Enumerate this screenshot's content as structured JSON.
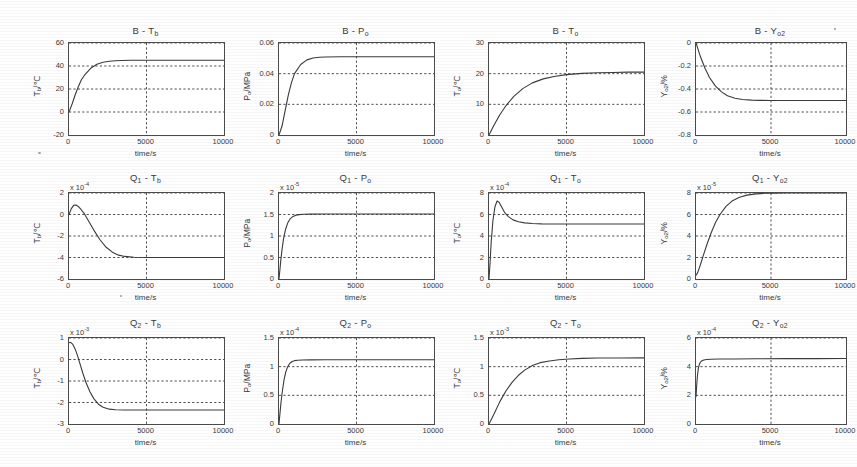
{
  "figure": {
    "xlabel": "time/s",
    "xticks": [
      "0",
      "5000",
      "10000"
    ],
    "background": "#ffffff",
    "line_color": "#3a3a3a",
    "grid_color": "#3a3a3a",
    "axis_color": "#4a4a4a"
  },
  "chart_data": [
    {
      "id": "b-tb",
      "type": "line",
      "title": "B - Tb",
      "title_main": "B - T",
      "title_sub": "b",
      "xlabel": "time/s",
      "ylabel_main": "T",
      "ylabel_sub": "b",
      "ylabel_unit": "/℃",
      "ylabel": "Tb/℃",
      "exponent": "",
      "xlim": [
        0,
        10000
      ],
      "ylim": [
        -20,
        60
      ],
      "xticks": [
        0,
        5000,
        10000
      ],
      "xticklabels": [
        "0",
        "5000",
        "10000"
      ],
      "yticks": [
        -20,
        0,
        20,
        40,
        60
      ],
      "yticklabels": [
        "-20",
        "0",
        "20",
        "40",
        "60"
      ],
      "grid": true,
      "x": [
        0,
        200,
        400,
        600,
        800,
        1000,
        1400,
        1800,
        2200,
        2600,
        3000,
        3400,
        4000,
        5000,
        6000,
        8000,
        10000
      ],
      "y": [
        0,
        7,
        15,
        22,
        28,
        32,
        38,
        41.5,
        43.3,
        44.1,
        44.6,
        44.8,
        45,
        45,
        45,
        45,
        45
      ]
    },
    {
      "id": "b-po",
      "type": "line",
      "title_main": "B - P",
      "title_sub": "o",
      "xlabel": "time/s",
      "ylabel_main": "P",
      "ylabel_sub": "o",
      "ylabel_unit": "/MPa",
      "ylabel": "Po/MPa",
      "exponent": "",
      "xlim": [
        0,
        10000
      ],
      "ylim": [
        0,
        0.06
      ],
      "xticks": [
        0,
        5000,
        10000
      ],
      "xticklabels": [
        "0",
        "5000",
        "10000"
      ],
      "yticks": [
        0,
        0.02,
        0.04,
        0.06
      ],
      "yticklabels": [
        "0",
        "0.02",
        "0.04",
        "0.06"
      ],
      "grid": true,
      "x": [
        0,
        200,
        400,
        600,
        800,
        1000,
        1400,
        1800,
        2200,
        2600,
        3000,
        4000,
        5000,
        7000,
        10000
      ],
      "y": [
        0,
        0.006,
        0.016,
        0.026,
        0.034,
        0.04,
        0.046,
        0.049,
        0.0502,
        0.0507,
        0.0509,
        0.051,
        0.051,
        0.051,
        0.051
      ]
    },
    {
      "id": "b-to",
      "type": "line",
      "title_main": "B - T",
      "title_sub": "o",
      "xlabel": "time/s",
      "ylabel_main": "T",
      "ylabel_sub": "o",
      "ylabel_unit": "/℃",
      "ylabel": "To/℃",
      "exponent": "",
      "xlim": [
        0,
        10000
      ],
      "ylim": [
        0,
        30
      ],
      "xticks": [
        0,
        5000,
        10000
      ],
      "xticklabels": [
        "0",
        "5000",
        "10000"
      ],
      "yticks": [
        0,
        10,
        20,
        30
      ],
      "yticklabels": [
        "0",
        "10",
        "20",
        "30"
      ],
      "grid": true,
      "x": [
        0,
        300,
        700,
        1100,
        1600,
        2200,
        2800,
        3500,
        4200,
        5000,
        6000,
        7000,
        8000,
        9000,
        10000
      ],
      "y": [
        0,
        3.0,
        6.6,
        9.6,
        12.6,
        15.2,
        17.0,
        18.3,
        19.1,
        19.7,
        20.1,
        20.3,
        20.4,
        20.5,
        20.5
      ]
    },
    {
      "id": "b-yo2",
      "type": "line",
      "title_main": "B - Y",
      "title_sub": "o2",
      "xlabel": "time/s",
      "ylabel_main": "Y",
      "ylabel_sub": "o2",
      "ylabel_unit": "/%",
      "ylabel": "Yo2/%",
      "exponent": "",
      "xlim": [
        0,
        10000
      ],
      "ylim": [
        -0.8,
        0
      ],
      "xticks": [
        0,
        5000,
        10000
      ],
      "xticklabels": [
        "0",
        "5000",
        "10000"
      ],
      "yticks": [
        -0.8,
        -0.6,
        -0.4,
        -0.2,
        0
      ],
      "yticklabels": [
        "-0.8",
        "-0.6",
        "-0.4",
        "-0.2",
        "0"
      ],
      "grid": true,
      "x": [
        0,
        300,
        600,
        900,
        1300,
        1700,
        2100,
        2600,
        3100,
        3700,
        4300,
        5000,
        7000,
        10000
      ],
      "y": [
        0,
        -0.12,
        -0.22,
        -0.3,
        -0.375,
        -0.425,
        -0.458,
        -0.48,
        -0.491,
        -0.497,
        -0.499,
        -0.5,
        -0.5,
        -0.5
      ]
    },
    {
      "id": "q1-tb",
      "type": "line",
      "title_main": "Q",
      "title_sub": "1",
      "title_tail": " - T",
      "title_tail_sub": "b",
      "xlabel": "time/s",
      "ylabel_main": "T",
      "ylabel_sub": "b",
      "ylabel_unit": "/℃",
      "ylabel": "Tb/℃",
      "exponent": "x 10",
      "exponent_sup": "-4",
      "xlim": [
        0,
        10000
      ],
      "ylim": [
        -6,
        2
      ],
      "xticks": [
        0,
        5000,
        10000
      ],
      "xticklabels": [
        "0",
        "5000",
        "10000"
      ],
      "yticks": [
        -6,
        -4,
        -2,
        0,
        2
      ],
      "yticklabels": [
        "-6",
        "-4",
        "-2",
        "0",
        "2"
      ],
      "grid": true,
      "x": [
        0,
        150,
        300,
        450,
        600,
        800,
        1000,
        1300,
        1600,
        2000,
        2400,
        2800,
        3200,
        3600,
        4200,
        5000,
        7000,
        10000
      ],
      "y": [
        0,
        0.55,
        0.85,
        0.88,
        0.75,
        0.42,
        0.05,
        -0.7,
        -1.45,
        -2.35,
        -3.05,
        -3.5,
        -3.78,
        -3.9,
        -3.97,
        -4.0,
        -4.0,
        -4.0
      ]
    },
    {
      "id": "q1-po",
      "type": "line",
      "title_main": "Q",
      "title_sub": "1",
      "title_tail": " - P",
      "title_tail_sub": "o",
      "xlabel": "time/s",
      "ylabel_main": "P",
      "ylabel_sub": "o",
      "ylabel_unit": "/MPa",
      "ylabel": "Po/MPa",
      "exponent": "x 10",
      "exponent_sup": "-5",
      "xlim": [
        0,
        10000
      ],
      "ylim": [
        0,
        2
      ],
      "xticks": [
        0,
        5000,
        10000
      ],
      "xticklabels": [
        "0",
        "5000",
        "10000"
      ],
      "yticks": [
        0,
        0.5,
        1,
        1.5,
        2
      ],
      "yticklabels": [
        "0",
        "0.5",
        "1",
        "1.5",
        "2"
      ],
      "grid": true,
      "x": [
        0,
        60,
        120,
        200,
        300,
        420,
        560,
        720,
        900,
        1100,
        1300,
        1600,
        2000,
        3000,
        5000,
        10000
      ],
      "y": [
        0,
        0.22,
        0.45,
        0.7,
        0.95,
        1.15,
        1.3,
        1.4,
        1.455,
        1.485,
        1.498,
        1.505,
        1.508,
        1.51,
        1.51,
        1.51
      ]
    },
    {
      "id": "q1-to",
      "type": "line",
      "title_main": "Q",
      "title_sub": "1",
      "title_tail": " - T",
      "title_tail_sub": "o",
      "xlabel": "time/s",
      "ylabel_main": "T",
      "ylabel_sub": "o",
      "ylabel_unit": "/℃",
      "ylabel": "To/℃",
      "exponent": "x 10",
      "exponent_sup": "-4",
      "xlim": [
        0,
        10000
      ],
      "ylim": [
        0,
        8
      ],
      "xticks": [
        0,
        5000,
        10000
      ],
      "xticklabels": [
        "0",
        "5000",
        "10000"
      ],
      "yticks": [
        0,
        2,
        4,
        6,
        8
      ],
      "yticklabels": [
        "0",
        "2",
        "4",
        "6",
        "8"
      ],
      "grid": true,
      "x": [
        0,
        60,
        140,
        250,
        380,
        520,
        650,
        800,
        1000,
        1250,
        1550,
        1900,
        2300,
        2800,
        3400,
        4200,
        5000,
        7000,
        10000
      ],
      "y": [
        0,
        1.3,
        3.4,
        5.4,
        6.7,
        7.25,
        7.15,
        6.75,
        6.2,
        5.8,
        5.5,
        5.33,
        5.22,
        5.16,
        5.13,
        5.12,
        5.12,
        5.12,
        5.12
      ]
    },
    {
      "id": "q1-yo2",
      "type": "line",
      "title_main": "Q",
      "title_sub": "1",
      "title_tail": " - Y",
      "title_tail_sub": "o2",
      "xlabel": "time/s",
      "ylabel_main": "Y",
      "ylabel_sub": "o2",
      "ylabel_unit": "/%",
      "ylabel": "Yo2/%",
      "exponent": "x 10",
      "exponent_sup": "-5",
      "xlim": [
        0,
        10000
      ],
      "ylim": [
        0,
        8
      ],
      "xticks": [
        0,
        5000,
        10000
      ],
      "xticklabels": [
        "0",
        "5000",
        "10000"
      ],
      "yticks": [
        0,
        2,
        4,
        6,
        8
      ],
      "yticklabels": [
        "0",
        "2",
        "4",
        "6",
        "8"
      ],
      "grid": true,
      "x": [
        0,
        100,
        300,
        500,
        750,
        1000,
        1300,
        1600,
        2000,
        2400,
        2900,
        3400,
        4000,
        4600,
        5200,
        6000,
        8000,
        10000
      ],
      "y": [
        0.35,
        0.55,
        1.35,
        2.25,
        3.3,
        4.25,
        5.25,
        6.0,
        6.75,
        7.25,
        7.6,
        7.8,
        7.92,
        7.97,
        7.99,
        8.0,
        8.0,
        8.0
      ]
    },
    {
      "id": "q2-tb",
      "type": "line",
      "title_main": "Q",
      "title_sub": "2",
      "title_tail": " - T",
      "title_tail_sub": "b",
      "xlabel": "time/s",
      "ylabel_main": "T",
      "ylabel_sub": "b",
      "ylabel_unit": "/℃",
      "ylabel": "Tb/℃",
      "exponent": "x 10",
      "exponent_sup": "-3",
      "xlim": [
        0,
        10000
      ],
      "ylim": [
        -3,
        1
      ],
      "xticks": [
        0,
        5000,
        10000
      ],
      "xticklabels": [
        "0",
        "5000",
        "10000"
      ],
      "yticks": [
        -3,
        -2,
        -1,
        0,
        1
      ],
      "yticklabels": [
        "-3",
        "-2",
        "-1",
        "0",
        "1"
      ],
      "grid": true,
      "x": [
        0,
        100,
        250,
        400,
        550,
        700,
        900,
        1100,
        1350,
        1600,
        1900,
        2200,
        2600,
        3000,
        3600,
        5000,
        7000,
        10000
      ],
      "y": [
        0.78,
        0.8,
        0.7,
        0.48,
        0.18,
        -0.18,
        -0.65,
        -1.08,
        -1.5,
        -1.82,
        -2.08,
        -2.22,
        -2.31,
        -2.34,
        -2.35,
        -2.35,
        -2.35,
        -2.35
      ]
    },
    {
      "id": "q2-po",
      "type": "line",
      "title_main": "Q",
      "title_sub": "2",
      "title_tail": " - P",
      "title_tail_sub": "o",
      "xlabel": "time/s",
      "ylabel_main": "P",
      "ylabel_sub": "o",
      "ylabel_unit": "/MPa",
      "ylabel": "Po/MPa",
      "exponent": "x 10",
      "exponent_sup": "-4",
      "xlim": [
        0,
        10000
      ],
      "ylim": [
        0,
        1.5
      ],
      "xticks": [
        0,
        5000,
        10000
      ],
      "xticklabels": [
        "0",
        "5000",
        "10000"
      ],
      "yticks": [
        0,
        0.5,
        1,
        1.5
      ],
      "yticklabels": [
        "0",
        "0.5",
        "1",
        "1.5"
      ],
      "grid": true,
      "x": [
        0,
        60,
        130,
        220,
        320,
        430,
        560,
        700,
        850,
        1000,
        1200,
        1500,
        2000,
        3000,
        5000,
        10000
      ],
      "y": [
        0,
        0.18,
        0.38,
        0.58,
        0.76,
        0.9,
        1.0,
        1.06,
        1.09,
        1.105,
        1.112,
        1.115,
        1.118,
        1.12,
        1.12,
        1.12
      ]
    },
    {
      "id": "q2-to",
      "type": "line",
      "title_main": "Q",
      "title_sub": "2",
      "title_tail": " - T",
      "title_tail_sub": "o",
      "xlabel": "time/s",
      "ylabel_main": "T",
      "ylabel_sub": "o",
      "ylabel_unit": "/℃",
      "ylabel": "To/℃",
      "exponent": "x 10",
      "exponent_sup": "-3",
      "xlim": [
        0,
        10000
      ],
      "ylim": [
        0,
        1.5
      ],
      "xticks": [
        0,
        5000,
        10000
      ],
      "xticklabels": [
        "0",
        "5000",
        "10000"
      ],
      "yticks": [
        0,
        0.5,
        1,
        1.5
      ],
      "yticklabels": [
        "0",
        "0.5",
        "1",
        "1.5"
      ],
      "grid": true,
      "x": [
        0,
        300,
        700,
        1100,
        1500,
        1900,
        2300,
        2800,
        3300,
        3900,
        4500,
        5200,
        6000,
        7000,
        8500,
        10000
      ],
      "y": [
        0,
        0.16,
        0.39,
        0.58,
        0.73,
        0.85,
        0.94,
        1.02,
        1.07,
        1.1,
        1.12,
        1.135,
        1.145,
        1.15,
        1.152,
        1.153
      ]
    },
    {
      "id": "q2-yo2",
      "type": "line",
      "title_main": "Q",
      "title_sub": "2",
      "title_tail": " - Y",
      "title_tail_sub": "o2",
      "xlabel": "time/s",
      "ylabel_main": "Y",
      "ylabel_sub": "o2",
      "ylabel_unit": "/%",
      "ylabel": "Yo2/%",
      "exponent": "x 10",
      "exponent_sup": "-4",
      "xlim": [
        0,
        10000
      ],
      "ylim": [
        0,
        6
      ],
      "xticks": [
        0,
        5000,
        10000
      ],
      "xticklabels": [
        "0",
        "5000",
        "10000"
      ],
      "yticks": [
        0,
        2,
        4,
        6
      ],
      "yticklabels": [
        "0",
        "2",
        "4",
        "6"
      ],
      "grid": true,
      "x": [
        0,
        40,
        90,
        150,
        220,
        300,
        400,
        520,
        700,
        1000,
        1500,
        2500,
        4000,
        6000,
        8000,
        10000
      ],
      "y": [
        1.9,
        2.6,
        3.3,
        3.85,
        4.15,
        4.32,
        4.42,
        4.47,
        4.5,
        4.52,
        4.53,
        4.54,
        4.55,
        4.56,
        4.56,
        4.57
      ]
    }
  ]
}
